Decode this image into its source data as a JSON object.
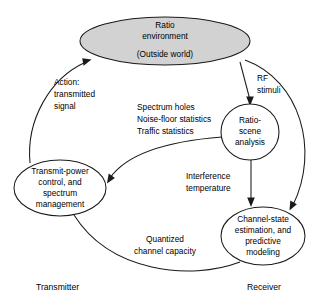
{
  "diagram": {
    "colors": {
      "stroke": "#1a1a1a",
      "node_fill": "#ffffff",
      "shaded_fill": "#d2d2d2",
      "background": "#ffffff",
      "text": "#000000"
    },
    "nodes": [
      {
        "id": "ratio-environment",
        "shape": "ellipse",
        "shaded": true,
        "lines": [
          "Ratio",
          "environment",
          "(Outside world)"
        ]
      },
      {
        "id": "ratio-scene-analysis",
        "shape": "ellipse",
        "shaded": false,
        "lines": [
          "Ratio-",
          "scene",
          "analysis"
        ]
      },
      {
        "id": "transmit-power-control",
        "shape": "ellipse",
        "shaded": false,
        "lines": [
          "Transmit-power",
          "control, and",
          "spectrum",
          "management"
        ]
      },
      {
        "id": "channel-state-estimation",
        "shape": "ellipse",
        "shaded": false,
        "lines": [
          "Channel-state",
          "estimation, and",
          "predictive",
          "modeling"
        ]
      }
    ],
    "edge_labels": [
      {
        "id": "action-transmitted-signal",
        "lines": [
          "Action:",
          "transmitted",
          "signal"
        ]
      },
      {
        "id": "rf-stimuli",
        "lines": [
          "RF",
          "stimuli"
        ]
      },
      {
        "id": "spectrum-statistics",
        "lines": [
          "Spectrum holes",
          "Noise-floor statistics",
          "Traffic statistics"
        ]
      },
      {
        "id": "interference-temperature",
        "lines": [
          "Interference",
          "temperature"
        ]
      },
      {
        "id": "quantized-channel-capacity",
        "lines": [
          "Quantized",
          "channel capacity"
        ]
      }
    ],
    "corner_labels": [
      {
        "id": "transmitter",
        "text": "Transmitter"
      },
      {
        "id": "receiver",
        "text": "Receiver"
      }
    ]
  }
}
